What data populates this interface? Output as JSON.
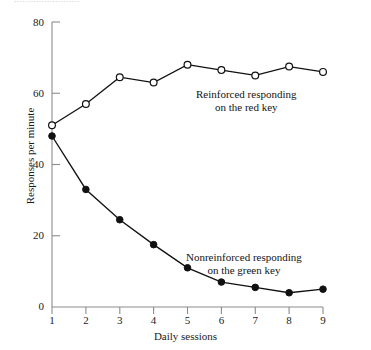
{
  "caption_sliver": "……………………",
  "chart_data": {
    "type": "line",
    "title": "",
    "xlabel": "Daily sessions",
    "ylabel": "Responses per minute",
    "x": [
      1,
      2,
      3,
      4,
      5,
      6,
      7,
      8,
      9
    ],
    "categories": [
      "1",
      "2",
      "3",
      "4",
      "5",
      "6",
      "7",
      "8",
      "9"
    ],
    "xlim": [
      1,
      9
    ],
    "ylim": [
      0,
      80
    ],
    "yticks": [
      0,
      20,
      40,
      60,
      80
    ],
    "ytick_labels": [
      "0",
      "20",
      "40",
      "60",
      "80"
    ],
    "xticks": [
      1,
      2,
      3,
      4,
      5,
      6,
      7,
      8,
      9
    ],
    "grid": false,
    "legend_position": "inline-annotations",
    "series": [
      {
        "name": "Reinforced responding on the red key",
        "marker": "open-circle",
        "color": "#000000",
        "values": [
          51,
          57,
          64.5,
          63,
          68,
          66.5,
          65,
          67.5,
          66
        ]
      },
      {
        "name": "Nonreinforced responding on the green key",
        "marker": "filled-circle",
        "color": "#000000",
        "values": [
          48,
          33,
          24.5,
          17.5,
          11,
          7,
          5.5,
          4,
          5
        ]
      }
    ],
    "annotations": [
      {
        "id": "red",
        "line1": "Reinforced responding",
        "line2": "on the red key"
      },
      {
        "id": "green",
        "line1": "Nonreinforced responding",
        "line2": "on the green key"
      }
    ],
    "axis_color": "#8c8c8c",
    "line_color": "#111111"
  }
}
